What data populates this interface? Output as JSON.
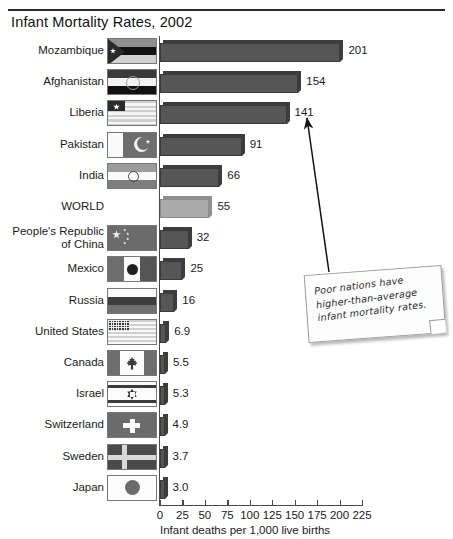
{
  "title": "Infant Mortality Rates, 2002",
  "annotation": {
    "text": "Poor nations have higher-than-average infant mortality rates.",
    "points_to": "141"
  },
  "chart_data": {
    "type": "bar",
    "orientation": "horizontal",
    "title": "Infant Mortality Rates, 2002",
    "xlabel": "Infant deaths per 1,000 live births",
    "ylabel": "",
    "xlim": [
      0,
      225
    ],
    "xticks": [
      0,
      25,
      50,
      75,
      100,
      125,
      150,
      175,
      200,
      225
    ],
    "tick_labels": [
      "0",
      "25",
      "50",
      "75",
      "100",
      "125",
      "150",
      "175",
      "200",
      "225"
    ],
    "grid": false,
    "legend": "none",
    "categories": [
      "Mozambique",
      "Afghanistan",
      "Liberia",
      "Pakistan",
      "India",
      "WORLD",
      "People's Republic\nof China",
      "Mexico",
      "Russia",
      "United States",
      "Canada",
      "Israel",
      "Switzerland",
      "Sweden",
      "Japan"
    ],
    "values": [
      201,
      154,
      141,
      91,
      66,
      55,
      32,
      25,
      16,
      6.9,
      5.5,
      5.3,
      4.9,
      3.7,
      3.0
    ],
    "value_labels": [
      "201",
      "154",
      "141",
      "91",
      "66",
      "55",
      "32",
      "25",
      "16",
      "6.9",
      "5.5",
      "5.3",
      "4.9",
      "3.7",
      "3.0"
    ],
    "highlight_category": "WORLD",
    "colors": {
      "bar": "#565656",
      "bar_highlight": "#ababab",
      "bar_shade": "#3d3d3d",
      "axis": "#4a4a4a"
    }
  },
  "rows": [
    {
      "country": "Mozambique",
      "value_label": "201",
      "value": 201,
      "flag": "mozambique-flag",
      "lines": 1,
      "highlight": false
    },
    {
      "country": "Afghanistan",
      "value_label": "154",
      "value": 154,
      "flag": "afghanistan-flag",
      "lines": 1,
      "highlight": false
    },
    {
      "country": "Liberia",
      "value_label": "141",
      "value": 141,
      "flag": "liberia-flag",
      "lines": 1,
      "highlight": false
    },
    {
      "country": "Pakistan",
      "value_label": "91",
      "value": 91,
      "flag": "pakistan-flag",
      "lines": 1,
      "highlight": false
    },
    {
      "country": "India",
      "value_label": "66",
      "value": 66,
      "flag": "india-flag",
      "lines": 1,
      "highlight": false
    },
    {
      "country": "WORLD",
      "value_label": "55",
      "value": 55,
      "flag": "none",
      "lines": 1,
      "highlight": true
    },
    {
      "country": "People's Republic\nof China",
      "value_label": "32",
      "value": 32,
      "flag": "china-flag",
      "lines": 2,
      "highlight": false
    },
    {
      "country": "Mexico",
      "value_label": "25",
      "value": 25,
      "flag": "mexico-flag",
      "lines": 1,
      "highlight": false
    },
    {
      "country": "Russia",
      "value_label": "16",
      "value": 16,
      "flag": "russia-flag",
      "lines": 1,
      "highlight": false
    },
    {
      "country": "United States",
      "value_label": "6.9",
      "value": 6.9,
      "flag": "united-states-flag",
      "lines": 1,
      "highlight": false
    },
    {
      "country": "Canada",
      "value_label": "5.5",
      "value": 5.5,
      "flag": "canada-flag",
      "lines": 1,
      "highlight": false
    },
    {
      "country": "Israel",
      "value_label": "5.3",
      "value": 5.3,
      "flag": "israel-flag",
      "lines": 1,
      "highlight": false
    },
    {
      "country": "Switzerland",
      "value_label": "4.9",
      "value": 4.9,
      "flag": "switzerland-flag",
      "lines": 1,
      "highlight": false
    },
    {
      "country": "Sweden",
      "value_label": "3.7",
      "value": 3.7,
      "flag": "sweden-flag",
      "lines": 1,
      "highlight": false
    },
    {
      "country": "Japan",
      "value_label": "3.0",
      "value": 3.0,
      "flag": "japan-flag",
      "lines": 1,
      "highlight": false
    }
  ],
  "axis": {
    "label": "Infant deaths per 1,000 live births",
    "ticks": [
      "0",
      "25",
      "50",
      "75",
      "100",
      "125",
      "150",
      "175",
      "200",
      "225"
    ]
  }
}
